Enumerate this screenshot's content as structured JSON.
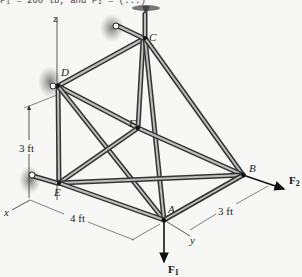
{
  "header_cut_text": "F₁ = 200 lb, and F₂ = (...)",
  "axes": {
    "x": "x",
    "y": "y",
    "z": "z"
  },
  "joints": {
    "A": "A",
    "B": "B",
    "C": "C",
    "D": "D",
    "E": "E",
    "F": "F"
  },
  "dimensions": {
    "vertical": "3 ft",
    "x_span": "4 ft",
    "y_span": "3 ft"
  },
  "forces": {
    "F1": {
      "main": "F",
      "sub": "1"
    },
    "F2": {
      "main": "F",
      "sub": "2"
    }
  },
  "supports": [
    "C: ball-and-socket (top)",
    "D: support",
    "E: support"
  ],
  "colors": {
    "background": "#f7f7f5",
    "member": "#333333",
    "highlight": "#bdbdbd",
    "shadow": "#777777"
  }
}
